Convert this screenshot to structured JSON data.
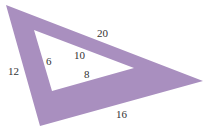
{
  "diagram": {
    "shape": "triangular frame (set square)",
    "fill_color": "#a98fbf",
    "outer_triangle": {
      "sides": [
        "20",
        "16",
        "12"
      ]
    },
    "inner_triangle": {
      "sides": [
        "10",
        "8",
        "6"
      ]
    },
    "labels": {
      "outer_top": "20",
      "outer_bottom": "16",
      "outer_left": "12",
      "inner_hyp": "10",
      "inner_bottom": "8",
      "inner_left": "6"
    }
  }
}
